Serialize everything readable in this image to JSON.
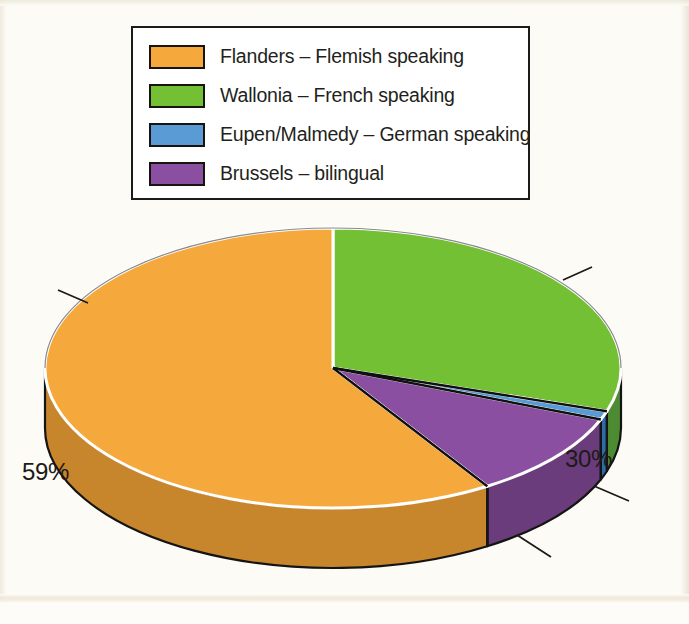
{
  "legend": {
    "items": [
      {
        "label": "Flanders – Flemish speaking",
        "color": "#f5a93c",
        "swatch_name": "legend-swatch-flanders"
      },
      {
        "label": "Wallonia – French speaking",
        "color": "#74c034",
        "swatch_name": "legend-swatch-wallonia"
      },
      {
        "label": "Eupen/Malmedy – German speaking",
        "color": "#5b9bd5",
        "swatch_name": "legend-swatch-eupen"
      },
      {
        "label": "Brussels – bilingual",
        "color": "#8a4fa0",
        "swatch_name": "legend-swatch-brussels"
      }
    ]
  },
  "labels": {
    "flanders_pct": "59%",
    "wallonia_pct": "30%",
    "eupen_pct": "1%",
    "brussels_pct": "10%"
  },
  "colors": {
    "background": "#fcfbf6",
    "legend_border": "#1b1b1b",
    "text": "#231f20",
    "orange_top": "#f5a93c",
    "orange_side": "#c8862c",
    "green_top": "#74c034",
    "green_side": "#4d8b33",
    "blue_top": "#5b9bd5",
    "blue_side": "#2e6ca8",
    "purple_top": "#8a4fa0",
    "purple_side": "#6b3c7c",
    "outline": "#141414",
    "separator": "#ffffff"
  },
  "chart_data": {
    "type": "pie",
    "title": "",
    "categories": [
      "Flanders – Flemish speaking",
      "Wallonia – French speaking",
      "Eupen/Malmedy – German speaking",
      "Brussels – bilingual"
    ],
    "values": [
      59,
      30,
      1,
      10
    ],
    "value_labels": [
      "59%",
      "30%",
      "1%",
      "10%"
    ],
    "units": "percent",
    "colors": [
      "#f5a93c",
      "#74c034",
      "#5b9bd5",
      "#8a4fa0"
    ],
    "legend_position": "top",
    "three_d": true,
    "start_angle_deg": 0,
    "direction": "clockwise",
    "slice_order_clockwise_from_12": [
      "Wallonia – French speaking",
      "Eupen/Malmedy – German speaking",
      "Brussels – bilingual",
      "Flanders – Flemish speaking"
    ],
    "labels_outside": true,
    "leader_lines": true,
    "grid": false,
    "xlabel": "",
    "ylabel": ""
  }
}
